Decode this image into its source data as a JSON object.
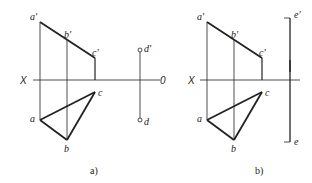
{
  "figure_a": {
    "caption": "a)",
    "axis_left": "X",
    "axis_right": "0",
    "labels": {
      "a1": "a'",
      "b1": "b'",
      "c1": "c'",
      "d1": "d'",
      "a": "a",
      "b": "b",
      "c": "c",
      "d": "d"
    }
  },
  "figure_b": {
    "caption": "b)",
    "axis_left": "X",
    "labels": {
      "a1": "a'",
      "b1": "b'",
      "c1": "c'",
      "e1": "e'",
      "a": "a",
      "b": "b",
      "c": "c",
      "e": "e"
    }
  },
  "colors": {
    "line": "#222222",
    "background": "#ffffff"
  }
}
